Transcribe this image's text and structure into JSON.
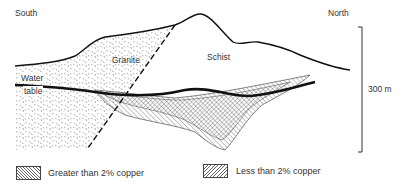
{
  "diagram": {
    "orientation": {
      "left": "South",
      "right": "North"
    },
    "rock_units": [
      {
        "name": "Granite",
        "pattern": "stipple"
      },
      {
        "name": "Schist",
        "pattern": "none"
      }
    ],
    "water_table_label_line1": "Water",
    "water_table_label_line2": "table",
    "scale_bar": {
      "label": "300 m"
    },
    "fault": {
      "style": "dashed"
    }
  },
  "legend": {
    "items": [
      {
        "label": "Greater than 2% copper",
        "pattern": "back-hatch"
      },
      {
        "label": "Less than 2% copper",
        "pattern": "forward-hatch"
      }
    ]
  },
  "colors": {
    "line": "#111111",
    "hatch": "#555555",
    "stipple": "#777777",
    "background": "#ffffff"
  }
}
